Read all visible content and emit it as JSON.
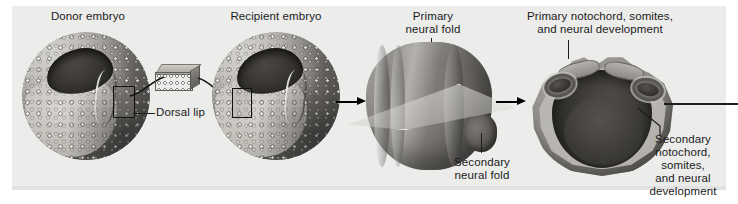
{
  "figure": {
    "background_color": "#ececeb",
    "page_background": "#ffffff",
    "width": 738,
    "height": 204
  },
  "labels": {
    "donor_embryo": "Donor embryo",
    "recipient_embryo": "Recipient embryo",
    "primary_neural_fold": "Primary\nneural fold",
    "secondary_neural_fold": "Secondary\nneural fold",
    "primary_development": "Primary notochord, somites,\nand neural development",
    "secondary_development": "Secondary\nnotochord,\nsomites,\nand neural\ndevelopment",
    "dorsal_lip": "Dorsal lip"
  },
  "stages": [
    {
      "index": 1,
      "name": "donor-embryo",
      "caption": "Donor embryo"
    },
    {
      "index": 2,
      "name": "recipient-embryo",
      "caption": "Recipient embryo"
    },
    {
      "index": 3,
      "name": "neurula-with-section-plane",
      "caption": "Primary neural fold"
    },
    {
      "index": 4,
      "name": "cross-section-embryo",
      "caption": "Primary notochord, somites, and neural development"
    }
  ],
  "arrows": [
    {
      "name": "arrow-recipient-to-neurula",
      "direction": "right"
    },
    {
      "name": "arrow-neurula-to-section",
      "direction": "right"
    }
  ],
  "colors": {
    "label_text": "#1b1b1b",
    "leader_line": "#1d1d1d",
    "arrow": "#000000",
    "panel": "#ececeb"
  }
}
